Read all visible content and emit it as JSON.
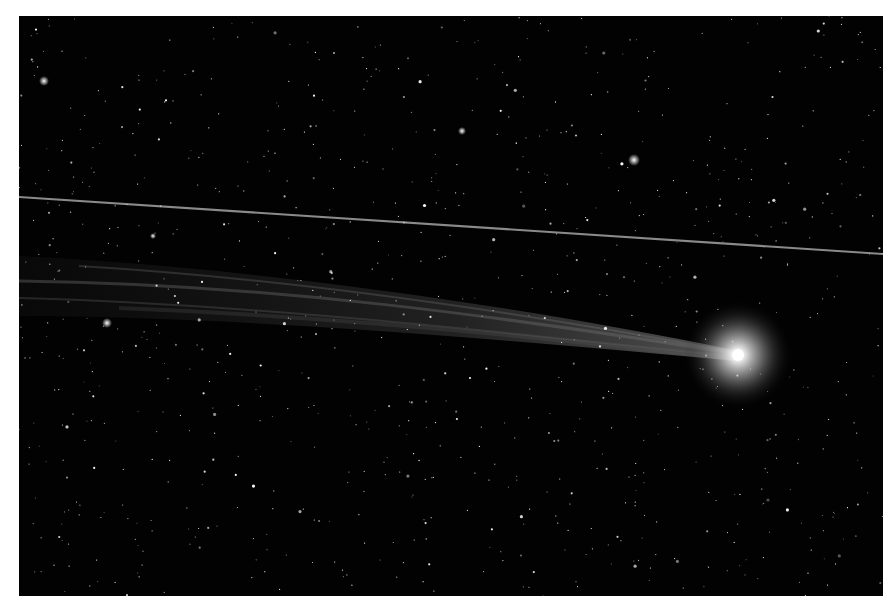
{
  "image": {
    "subject": "comet with long ion tail against star field",
    "background_color": "#020202",
    "frame_color": "#ffffff",
    "coma": {
      "cx": 719,
      "cy": 339,
      "color": "#ffffff"
    },
    "satellite_trail": {
      "x1": 0,
      "y1": 181,
      "x2": 864,
      "y2": 238,
      "color": "#8a8a8a"
    }
  }
}
